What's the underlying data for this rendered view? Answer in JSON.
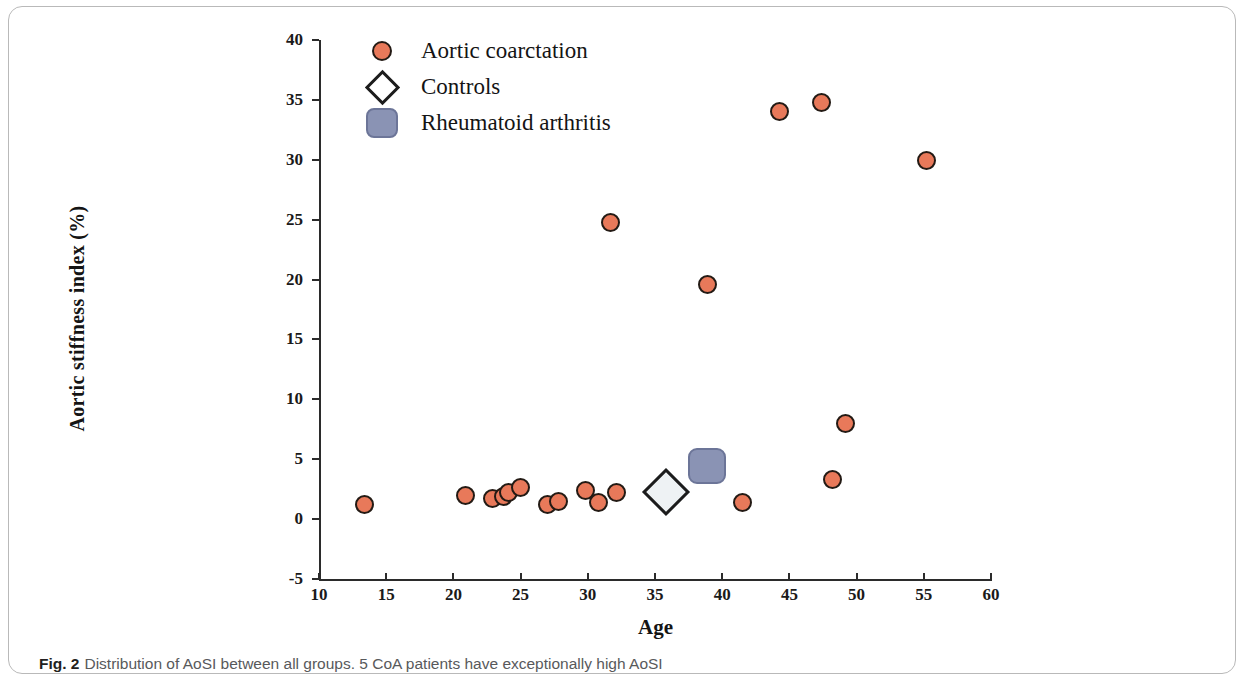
{
  "caption": {
    "label": "Fig. 2",
    "text": "Distribution of AoSI between all groups. 5 CoA patients have exceptionally high AoSI"
  },
  "colors": {
    "coa_fill": "#e8795a",
    "coa_edge": "#231a14",
    "control_fill": "#eef2f4",
    "control_edge": "#1c1c1c",
    "ra_fill": "#8a93b4",
    "ra_edge": "#6c7598",
    "axis": "#2b2b2b",
    "text": "#141414"
  },
  "chart_data": {
    "type": "scatter",
    "title": "",
    "xlabel": "Age",
    "ylabel": "Aortic stiffness index  (%)",
    "xlim": [
      10,
      60
    ],
    "ylim": [
      -5,
      40
    ],
    "xticks": [
      10,
      15,
      20,
      25,
      30,
      35,
      40,
      45,
      50,
      55,
      60
    ],
    "yticks": [
      -5,
      0,
      5,
      10,
      15,
      20,
      25,
      30,
      35,
      40
    ],
    "grid": false,
    "legend_position": "top-left",
    "series": [
      {
        "name": "Aortic coarctation",
        "marker": "circle",
        "points": [
          [
            13.4,
            1.2
          ],
          [
            20.9,
            2.0
          ],
          [
            22.9,
            1.7
          ],
          [
            23.7,
            1.9
          ],
          [
            24.1,
            2.2
          ],
          [
            25.0,
            2.6
          ],
          [
            27.0,
            1.2
          ],
          [
            27.8,
            1.5
          ],
          [
            29.8,
            2.4
          ],
          [
            30.8,
            1.4
          ],
          [
            31.7,
            24.8
          ],
          [
            32.1,
            2.2
          ],
          [
            38.9,
            19.6
          ],
          [
            41.5,
            1.4
          ],
          [
            44.3,
            34.0
          ],
          [
            47.4,
            34.8
          ],
          [
            48.2,
            3.3
          ],
          [
            49.2,
            8.0
          ],
          [
            55.2,
            29.9
          ]
        ]
      },
      {
        "name": "Controls",
        "marker": "diamond",
        "points": [
          [
            35.8,
            2.3
          ]
        ]
      },
      {
        "name": "Rheumatoid arthritis",
        "marker": "square",
        "points": [
          [
            38.9,
            4.4
          ]
        ]
      }
    ]
  }
}
